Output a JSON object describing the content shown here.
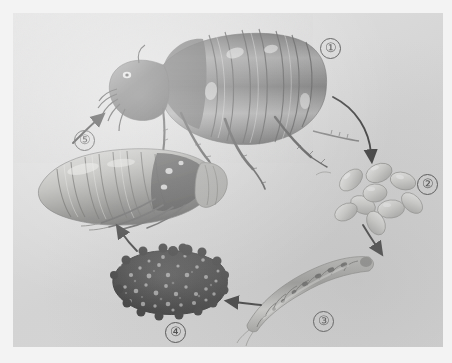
{
  "figure": {
    "kind": "photographic-plate",
    "orientation": "counterclockwise cycle",
    "background_color": "#d9d9d9",
    "page_color": "#f3f3f3",
    "ink_color": "#1e1e1e"
  },
  "labels": {
    "one": "①",
    "two": "②",
    "three": "③",
    "four": "④",
    "five": "⑤"
  },
  "stages": [
    {
      "number": "①",
      "name": "adult-flea",
      "label": "①",
      "description": "adult flea, lateral view"
    },
    {
      "number": "②",
      "name": "eggs",
      "label": "②",
      "description": "cluster of oval eggs",
      "egg_count": 9
    },
    {
      "number": "③",
      "name": "larva",
      "label": "③",
      "description": "curved segmented larva"
    },
    {
      "number": "④",
      "name": "cocoon",
      "label": "④",
      "description": "debris covered cocoon"
    },
    {
      "number": "⑤",
      "name": "pupa",
      "label": "⑤",
      "description": "pupa within cocoon, lateral view"
    }
  ],
  "arrows": [
    {
      "name": "adult-to-eggs",
      "from": "①",
      "to": "②",
      "style": "curved"
    },
    {
      "name": "eggs-to-larva",
      "from": "②",
      "to": "③",
      "style": "short-curved"
    },
    {
      "name": "larva-to-cocoon",
      "from": "③",
      "to": "④",
      "style": "straight"
    },
    {
      "name": "cocoon-to-pupa",
      "from": "④",
      "to": "⑤",
      "style": "straight"
    },
    {
      "name": "pupa-to-adult",
      "from": "⑤",
      "to": "①",
      "style": "straight"
    }
  ],
  "caption": {
    "text": "",
    "visible": false
  }
}
